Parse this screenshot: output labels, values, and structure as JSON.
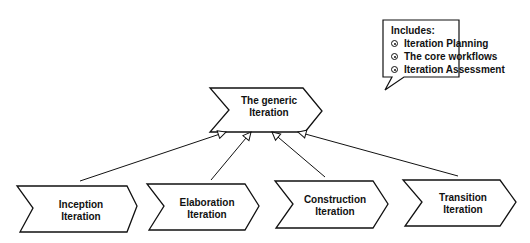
{
  "diagram": {
    "generic": {
      "line1": "The generic",
      "line2": "Iteration"
    },
    "phases": [
      {
        "line1": "Inception",
        "line2": "Iteration"
      },
      {
        "line1": "Elaboration",
        "line2": "Iteration"
      },
      {
        "line1": "Construction",
        "line2": "Iteration"
      },
      {
        "line1": "Transition",
        "line2": "Iteration"
      }
    ],
    "callout": {
      "title": "Includes:",
      "items": [
        "Iteration Planning",
        "The core workflows",
        "Iteration Assessment"
      ]
    },
    "relationship": "generalization"
  }
}
